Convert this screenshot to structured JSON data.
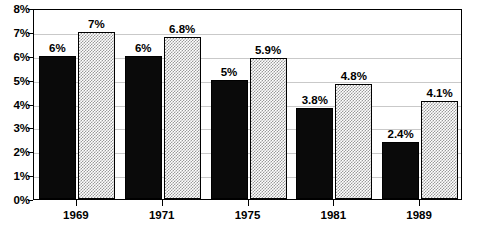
{
  "chart_data": {
    "type": "bar",
    "title": "",
    "subtitle": "",
    "xlabel": "",
    "ylabel": "",
    "categories": [
      "1969",
      "1971",
      "1975",
      "1981",
      "1989"
    ],
    "series": [
      {
        "name": "series-a",
        "fill": "solid-black",
        "color": "#000000",
        "values": [
          6,
          6,
          5,
          3.8,
          2.4
        ],
        "labels": [
          "6%",
          "6%",
          "5%",
          "3.8%",
          "2.4%"
        ]
      },
      {
        "name": "series-b",
        "fill": "checkered-gray",
        "color": "#9a9a9a",
        "values": [
          7,
          6.8,
          5.9,
          4.8,
          4.1
        ],
        "labels": [
          "7%",
          "6.8%",
          "5.9%",
          "4.8%",
          "4.1%"
        ]
      }
    ],
    "ylim": [
      0,
      8
    ],
    "ytick_values": [
      0,
      1,
      2,
      3,
      4,
      5,
      6,
      7,
      8
    ],
    "ytick_labels": [
      "0%",
      "1%",
      "2%",
      "3%",
      "4%",
      "5%",
      "6%",
      "7%",
      "8%"
    ],
    "grid": true,
    "grid_color": "#c9c9c9",
    "legend": "none",
    "plot_border_color": "#000000",
    "background": "#ffffff"
  }
}
